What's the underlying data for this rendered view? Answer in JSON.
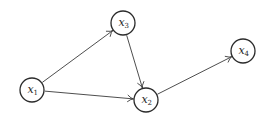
{
  "diagram": {
    "type": "directed-graph",
    "node_radius": 12,
    "colors": {
      "stroke": "#2b2b2b",
      "edge": "#3a3a3a",
      "fill": "#ffffff",
      "text": "#1e1e1e",
      "background": "#ffffff"
    },
    "nodes": [
      {
        "id": "x1",
        "label": "x",
        "subscript": "1",
        "cx": 32,
        "cy": 90
      },
      {
        "id": "x3",
        "label": "x",
        "subscript": "3",
        "cx": 123,
        "cy": 23
      },
      {
        "id": "x2",
        "label": "x",
        "subscript": "2",
        "cx": 146,
        "cy": 100
      },
      {
        "id": "x4",
        "label": "x",
        "subscript": "4",
        "cx": 243,
        "cy": 51
      }
    ],
    "edges": [
      {
        "from": "x1",
        "to": "x3"
      },
      {
        "from": "x1",
        "to": "x2"
      },
      {
        "from": "x3",
        "to": "x2"
      },
      {
        "from": "x2",
        "to": "x4"
      }
    ]
  }
}
